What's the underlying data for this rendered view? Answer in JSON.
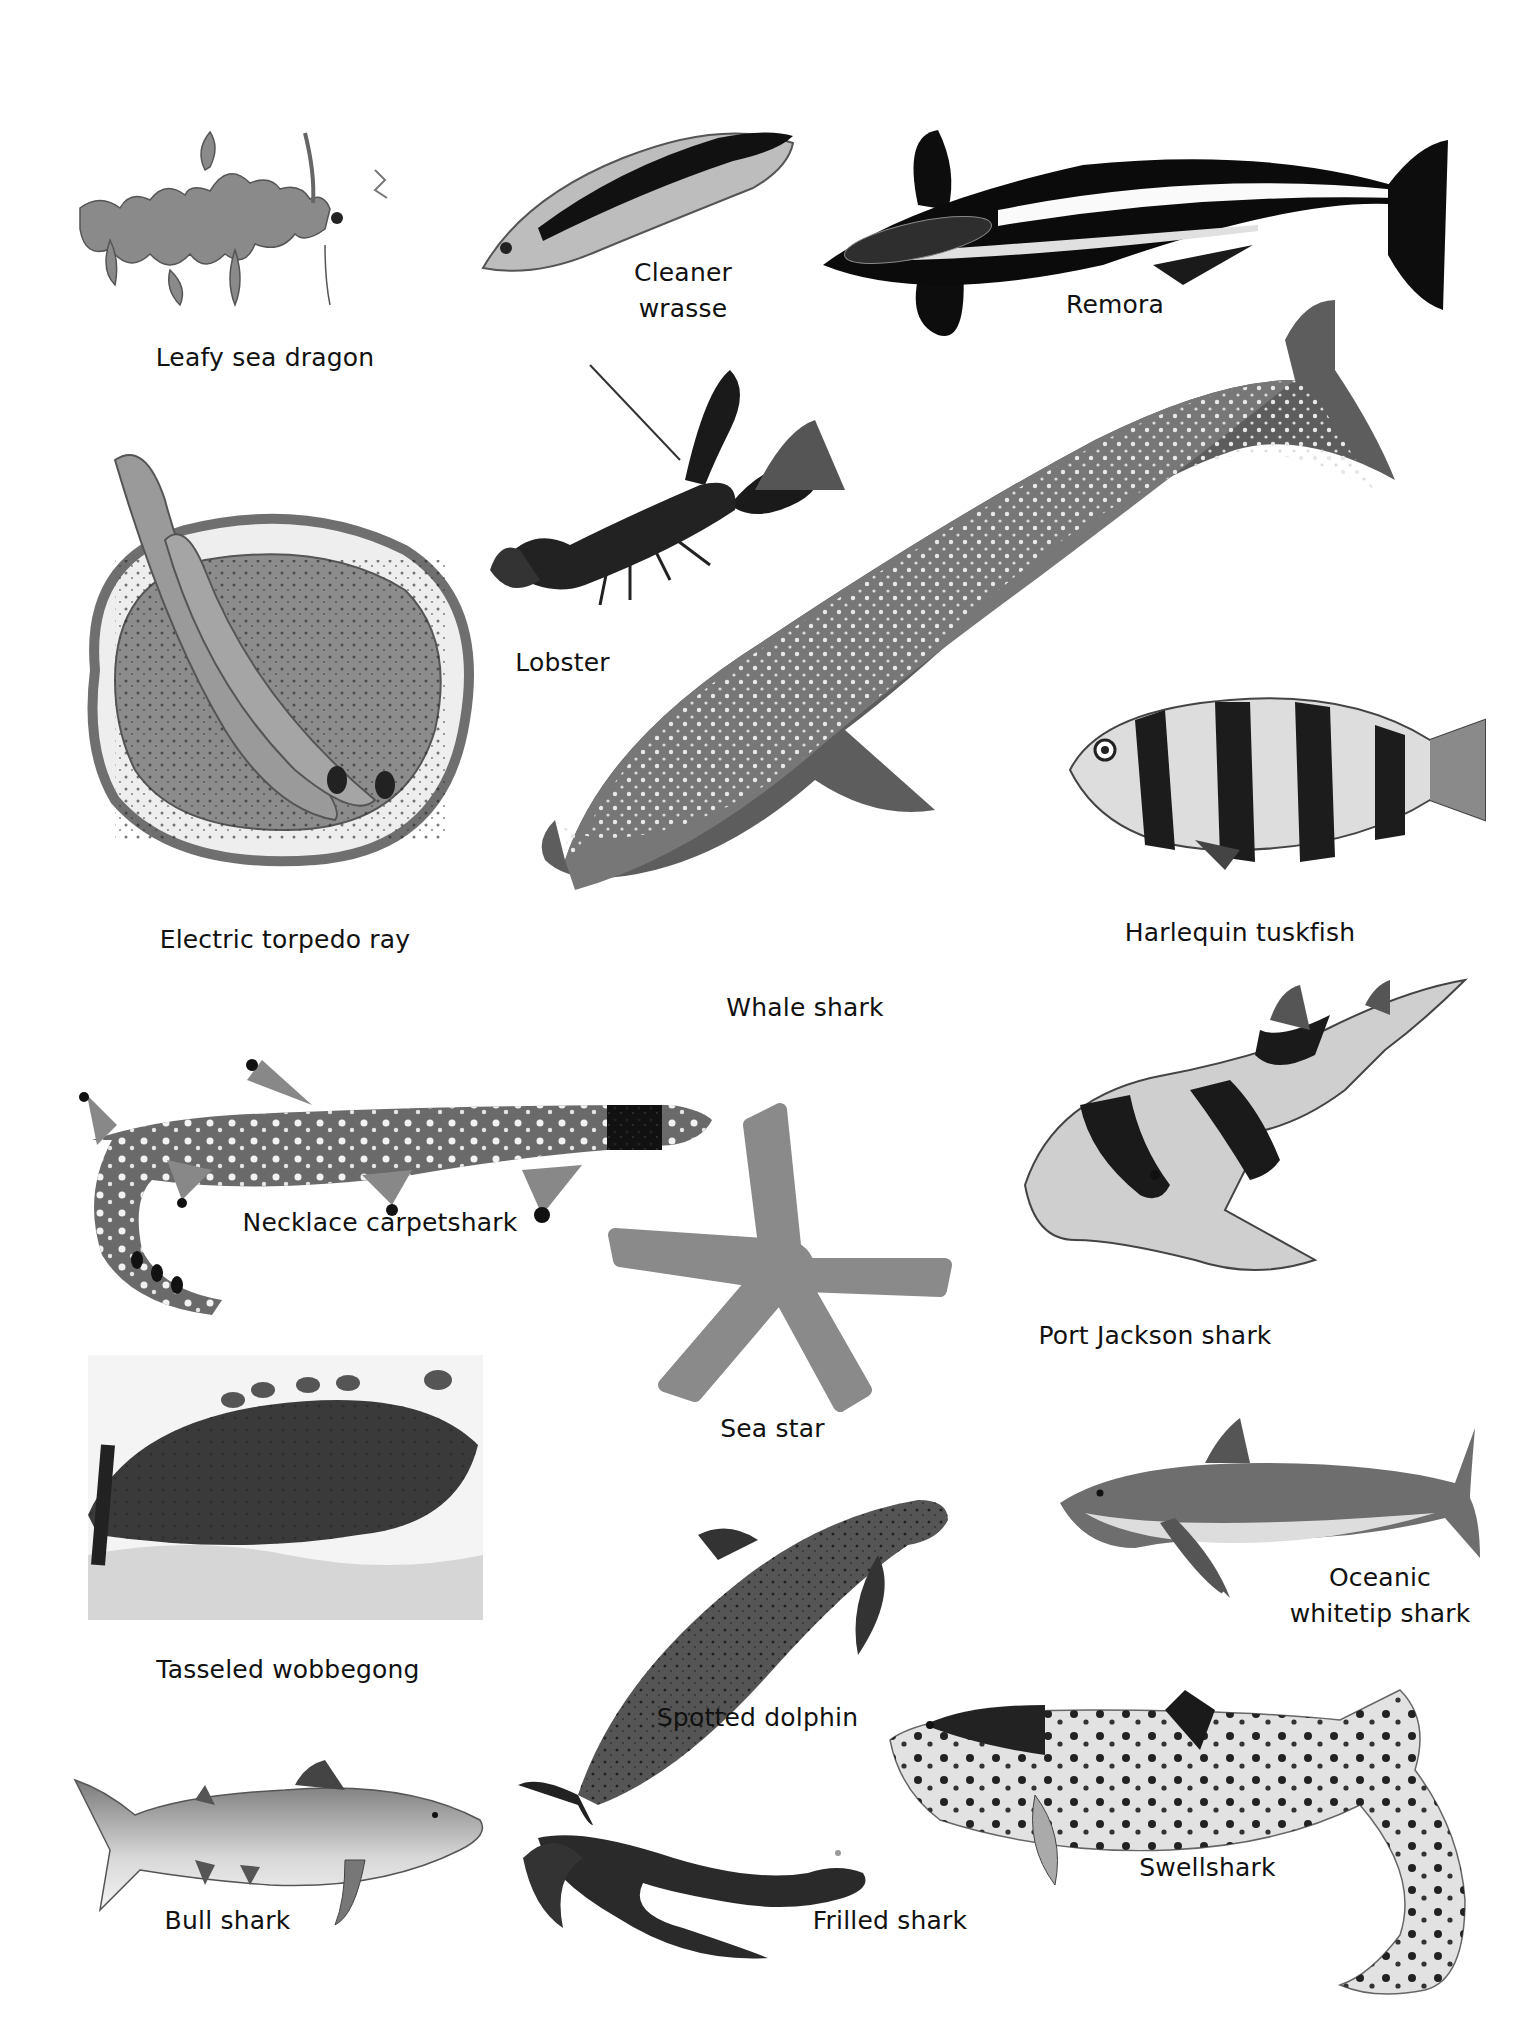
{
  "page": {
    "background": "#ffffff",
    "palette": {
      "ink": "#111111",
      "dark": "#1a1a1a",
      "mid": "#6b6b6b",
      "light": "#bdbdbd",
      "spot": "#e8e8e8"
    }
  },
  "creatures": [
    {
      "id": "leafy-sea-dragon",
      "label": "Leafy sea dragon"
    },
    {
      "id": "cleaner-wrasse",
      "label_line1": "Cleaner",
      "label_line2": "wrasse"
    },
    {
      "id": "remora",
      "label": "Remora"
    },
    {
      "id": "lobster",
      "label": "Lobster"
    },
    {
      "id": "electric-torpedo-ray",
      "label": "Electric torpedo ray"
    },
    {
      "id": "whale-shark",
      "label": "Whale shark"
    },
    {
      "id": "harlequin-tuskfish",
      "label": "Harlequin tuskfish"
    },
    {
      "id": "necklace-carpetshark",
      "label": "Necklace carpetshark"
    },
    {
      "id": "port-jackson-shark",
      "label": "Port Jackson shark"
    },
    {
      "id": "sea-star",
      "label": "Sea star"
    },
    {
      "id": "tasseled-wobbegong",
      "label": "Tasseled wobbegong"
    },
    {
      "id": "spotted-dolphin",
      "label": "Spotted dolphin"
    },
    {
      "id": "oceanic-whitetip-shark",
      "label_line1": "Oceanic",
      "label_line2": "whitetip shark"
    },
    {
      "id": "bull-shark",
      "label": "Bull shark"
    },
    {
      "id": "frilled-shark",
      "label": "Frilled shark"
    },
    {
      "id": "swellshark",
      "label": "Swellshark"
    }
  ]
}
